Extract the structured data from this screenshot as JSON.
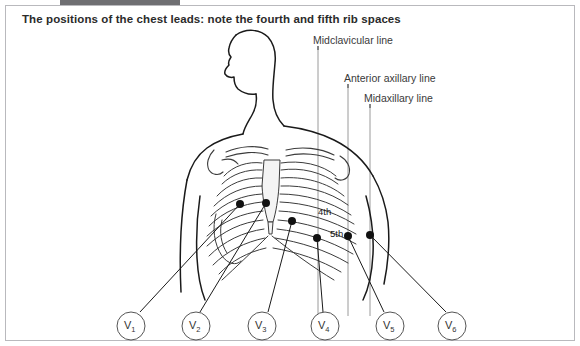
{
  "caption": "The positions of the chest leads: note the fourth and fifth rib spaces",
  "figure": {
    "type": "anatomical-diagram"
  },
  "reference_lines": [
    {
      "id": "midclavicular",
      "label": "Midclavicular line",
      "x": 318
    },
    {
      "id": "anterior-axillary",
      "label": "Anterior axillary line",
      "x": 348
    },
    {
      "id": "midaxillary",
      "label": "Midaxillary line",
      "x": 370
    }
  ],
  "rib_space_labels": [
    {
      "id": "fourth",
      "text": "4th"
    },
    {
      "id": "fifth",
      "text": "5th"
    }
  ],
  "electrodes": [
    {
      "id": "V1",
      "label": "V",
      "subscript": "1",
      "dot_x": 240,
      "dot_y": 204,
      "circle_x": 131,
      "circle_y": 326
    },
    {
      "id": "V2",
      "label": "V",
      "subscript": "2",
      "dot_x": 266,
      "dot_y": 203,
      "circle_x": 196,
      "circle_y": 326
    },
    {
      "id": "V3",
      "label": "V",
      "subscript": "3",
      "dot_x": 292,
      "dot_y": 221,
      "circle_x": 262,
      "circle_y": 326
    },
    {
      "id": "V4",
      "label": "V",
      "subscript": "4",
      "dot_x": 317,
      "dot_y": 238,
      "circle_x": 325,
      "circle_y": 326
    },
    {
      "id": "V5",
      "label": "V",
      "subscript": "5",
      "dot_x": 348,
      "dot_y": 236,
      "circle_x": 390,
      "circle_y": 326
    },
    {
      "id": "V6",
      "label": "V",
      "subscript": "6",
      "dot_x": 370,
      "dot_y": 235,
      "circle_x": 452,
      "circle_y": 326
    }
  ],
  "colors": {
    "frame_border": "#b9b9bd",
    "caption_text": "#2b2b2b",
    "label_text": "#3a3a3a",
    "ink": "#1a1a1a",
    "rib_line": "#3c3c3c",
    "reference_line": "#9a9a9a",
    "background": "#ffffff"
  }
}
